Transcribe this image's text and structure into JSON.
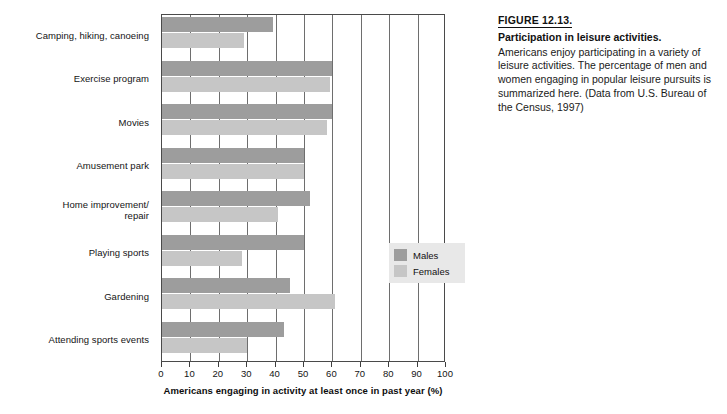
{
  "chart_data": {
    "type": "bar",
    "orientation": "horizontal",
    "title": "Participation in leisure activities.",
    "xlabel": "Americans engaging in activity at least once in past year (%)",
    "ylabel": "",
    "xlim": [
      0,
      100
    ],
    "xticks": [
      0,
      10,
      20,
      30,
      40,
      50,
      60,
      70,
      80,
      90,
      100
    ],
    "xtick_labels": [
      "0",
      "10",
      "20",
      "30",
      "40",
      "50",
      "60",
      "70",
      "80",
      "90",
      "100"
    ],
    "grid": true,
    "grid_axis": "x",
    "legend_position": "inside-right",
    "categories": [
      "Camping, hiking, canoeing",
      "Exercise program",
      "Movies",
      "Amusement park",
      "Home improvement/\nrepair",
      "Playing sports",
      "Gardening",
      "Attending sports events"
    ],
    "series": [
      {
        "name": "Males",
        "color": "#9d9d9d",
        "values": [
          39,
          60,
          60,
          50,
          52,
          50,
          45,
          43
        ]
      },
      {
        "name": "Females",
        "color": "#c6c6c6",
        "values": [
          29,
          59,
          58,
          50,
          41,
          28,
          61,
          30
        ]
      }
    ]
  },
  "chart": {
    "categories": [
      {
        "line1": "Camping, hiking, canoeing",
        "line2": ""
      },
      {
        "line1": "Exercise program",
        "line2": ""
      },
      {
        "line1": "Movies",
        "line2": ""
      },
      {
        "line1": "Amusement park",
        "line2": ""
      },
      {
        "line1": "Home improvement/",
        "line2": "repair"
      },
      {
        "line1": "Playing sports",
        "line2": ""
      },
      {
        "line1": "Gardening",
        "line2": ""
      },
      {
        "line1": "Attending sports events",
        "line2": ""
      }
    ],
    "legend": [
      {
        "label": "Males",
        "color": "#9d9d9d"
      },
      {
        "label": "Females",
        "color": "#c6c6c6"
      }
    ],
    "axis_title": "Americans engaging in activity at least once in past year (%)"
  },
  "caption": {
    "figure_number": "FIGURE 12.13.",
    "title": "Participation in leisure activities.",
    "body": "Americans enjoy participating in a variety of leisure activities. The percentage of men and women engaging in popular leisure pursuits is summarized here. (Data from U.S. Bureau of the Census, 1997)"
  }
}
